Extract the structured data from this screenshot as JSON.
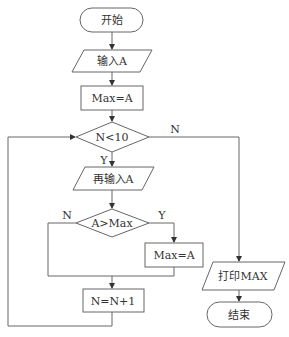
{
  "diagram": {
    "type": "flowchart",
    "nodes": {
      "start": {
        "shape": "terminal",
        "text": "开始"
      },
      "input": {
        "shape": "parallelogram",
        "text": "输入A"
      },
      "init_max": {
        "shape": "process",
        "text": "Max=A"
      },
      "cond_loop": {
        "shape": "decision",
        "text": "N<10"
      },
      "reinput": {
        "shape": "parallelogram",
        "text": "再输入A"
      },
      "cond_max": {
        "shape": "decision",
        "text": "A>Max"
      },
      "assign_max": {
        "shape": "process",
        "text": "Max=A"
      },
      "increment": {
        "shape": "process",
        "text": "N=N+1"
      },
      "print": {
        "shape": "parallelogram",
        "text": "打印MAX"
      },
      "end": {
        "shape": "terminal",
        "text": "结束"
      }
    },
    "edge_labels": {
      "cond_loop_no": "N",
      "cond_loop_yes": "Y",
      "cond_max_no": "N",
      "cond_max_yes": "Y"
    },
    "colors": {
      "line": "#555555",
      "text": "#333333",
      "background": "#ffffff"
    }
  }
}
